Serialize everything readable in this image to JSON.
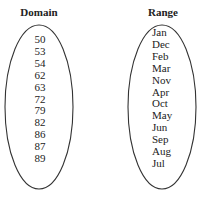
{
  "domain": {
    "title": "Domain",
    "items": [
      "50",
      "53",
      "54",
      "62",
      "63",
      "72",
      "79",
      "82",
      "86",
      "87",
      "89"
    ]
  },
  "range": {
    "title": "Range",
    "items": [
      "Jan",
      "Dec",
      "Feb",
      "Mar",
      "Nov",
      "Apr",
      "Oct",
      "May",
      "Jun",
      "Sep",
      "Aug",
      "Jul"
    ]
  }
}
